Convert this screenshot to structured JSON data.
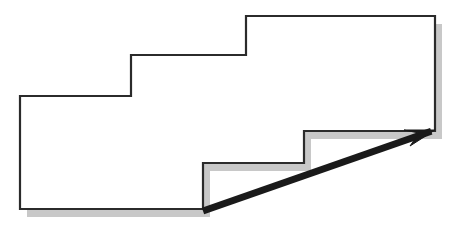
{
  "canvas": {
    "width": 462,
    "height": 233,
    "background": "#ffffff",
    "title": "Staircase polygon with diagonal arrow"
  },
  "colors": {
    "outline": "#2b2b2b",
    "fill": "#ffffff",
    "shadow": "#c8c8c8",
    "arrow": "#1a1a1a"
  },
  "shapes": {
    "staircase": {
      "label": "staircase-polygon",
      "stroke_width": 2.2,
      "points": "20,96 131,96 131,55 246,55 246,16 435,16 435,131 304,131 304,163 203,163 203,209 20,209"
    },
    "shadow": {
      "label": "drop-shadow",
      "offset_x": 7,
      "offset_y": 8,
      "points": "20,96 131,96 131,55 246,55 246,16 435,16 435,131 304,131 304,163 203,163 203,209 20,209"
    },
    "arrow": {
      "label": "diagonal-arrow",
      "start_x": 203,
      "start_y": 211,
      "tip_x": 435,
      "tip_y": 130,
      "shaft_width": 7,
      "head_points": "435,130 410,146 419,133 404,130"
    }
  },
  "chart_data": {
    "type": "diagram",
    "title": "Staircase polygon with diagonal arrow",
    "xlabel": "",
    "ylabel": "",
    "vertices": [
      {
        "name": "top-left-lower-step",
        "x": 20,
        "y": 96
      },
      {
        "name": "step1-riser-bottom",
        "x": 131,
        "y": 96
      },
      {
        "name": "step1-riser-top",
        "x": 131,
        "y": 55
      },
      {
        "name": "step2-riser-bottom",
        "x": 246,
        "y": 55
      },
      {
        "name": "step2-riser-top",
        "x": 246,
        "y": 16
      },
      {
        "name": "top-right",
        "x": 435,
        "y": 16
      },
      {
        "name": "right-bottom",
        "x": 435,
        "y": 131
      },
      {
        "name": "notch1-corner",
        "x": 304,
        "y": 131
      },
      {
        "name": "notch1-drop",
        "x": 304,
        "y": 163
      },
      {
        "name": "notch2-corner",
        "x": 203,
        "y": 163
      },
      {
        "name": "notch2-drop",
        "x": 203,
        "y": 209
      },
      {
        "name": "bottom-left",
        "x": 20,
        "y": 209
      }
    ],
    "annotations": [
      {
        "name": "arrow",
        "from": [
          203,
          211
        ],
        "to": [
          435,
          130
        ],
        "style": "solid thick with arrowhead"
      }
    ],
    "grid": false,
    "legend": null
  }
}
